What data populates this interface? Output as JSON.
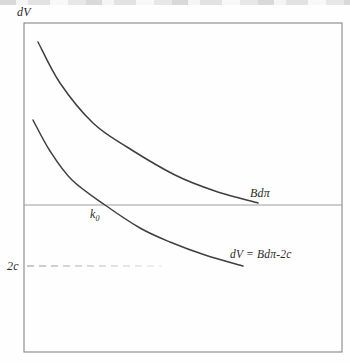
{
  "figure": {
    "y_axis_label": "dV",
    "upper_curve_label": "Bdπ",
    "lower_curve_label": "dV = Bdπ-2c",
    "k0_label": {
      "base": "k",
      "sub": "0"
    },
    "two_c_label": "2c"
  },
  "chart_data": {
    "type": "line",
    "title": "",
    "xlabel": "",
    "ylabel": "dV",
    "x_tick_labels": [],
    "y_tick_labels": [
      "2c"
    ],
    "legend": "none",
    "grid": false,
    "annotations": [
      "dV",
      "Bdπ",
      "dV = Bdπ-2c",
      "k₀",
      "2c"
    ],
    "series": [
      {
        "name": "Bdπ",
        "style": "solid",
        "points_px": [
          [
            38,
            42
          ],
          [
            60,
            83
          ],
          [
            93,
            123
          ],
          [
            127,
            147
          ],
          [
            175,
            175
          ],
          [
            215,
            191
          ],
          [
            258,
            203
          ]
        ]
      },
      {
        "name": "dV = Bdπ-2c",
        "style": "solid",
        "points_px": [
          [
            33,
            120
          ],
          [
            50,
            151
          ],
          [
            72,
            180
          ],
          [
            105,
            205
          ],
          [
            140,
            228
          ],
          [
            170,
            242
          ],
          [
            205,
            255
          ],
          [
            243,
            266
          ]
        ]
      }
    ],
    "layout_px": {
      "canvas": {
        "width": 350,
        "height": 363
      },
      "box": {
        "left": 24,
        "top": 23,
        "right": 342,
        "bottom": 352
      },
      "zero_line_y": 205,
      "k0_cross_x": 105,
      "dashed_line": {
        "y": 266,
        "x1": 27,
        "x2": 162
      }
    },
    "colors": {
      "curve": "#3f3f3f",
      "frame": "#7b7b7b",
      "zero_line": "#9e9e9e",
      "dashed": "#8d8d8d",
      "text": "#2b2b2b",
      "background": "#fefefe"
    }
  }
}
